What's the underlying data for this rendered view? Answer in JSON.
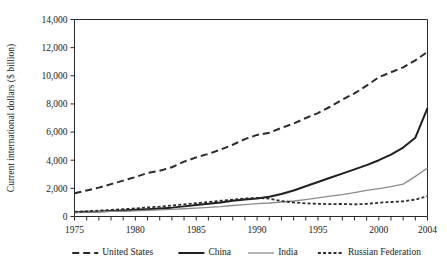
{
  "chart_data": {
    "type": "line",
    "title": "",
    "xlabel": "",
    "ylabel": "Current international dollars ($ billion)",
    "xlim": [
      1975,
      2004
    ],
    "ylim": [
      0,
      14000
    ],
    "grid": false,
    "legend_position": "bottom",
    "x_ticks_labeled": [
      "1975",
      "1980",
      "1985",
      "1990",
      "1995",
      "2000",
      "2004"
    ],
    "x_ticks_labeled_values": [
      1975,
      1980,
      1985,
      1990,
      1995,
      2000,
      2004
    ],
    "x_tick_interval_minor": 1,
    "y_ticks": [
      0,
      2000,
      4000,
      6000,
      8000,
      10000,
      12000,
      14000
    ],
    "y_tick_labels": [
      "0",
      "2,000",
      "4,000",
      "6,000",
      "8,000",
      "10,000",
      "12,000",
      "14,000"
    ],
    "x": [
      1975,
      1976,
      1977,
      1978,
      1979,
      1980,
      1981,
      1982,
      1983,
      1984,
      1985,
      1986,
      1987,
      1988,
      1989,
      1990,
      1991,
      1992,
      1993,
      1994,
      1995,
      1996,
      1997,
      1998,
      1999,
      2000,
      2001,
      2002,
      2003,
      2004
    ],
    "series": [
      {
        "name": "United States",
        "color": "#2b2b2b",
        "line_style": "long-dash",
        "line_width": 2,
        "values": [
          1650,
          1850,
          2050,
          2300,
          2550,
          2800,
          3100,
          3250,
          3500,
          3900,
          4200,
          4450,
          4750,
          5100,
          5500,
          5800,
          5950,
          6300,
          6600,
          7000,
          7350,
          7800,
          8300,
          8750,
          9300,
          9900,
          10250,
          10600,
          11100,
          11700
        ]
      },
      {
        "name": "China",
        "color": "#1f1f1f",
        "line_style": "solid",
        "line_width": 2,
        "values": [
          300,
          330,
          350,
          390,
          430,
          480,
          520,
          570,
          630,
          720,
          820,
          900,
          1000,
          1120,
          1200,
          1280,
          1400,
          1600,
          1850,
          2150,
          2450,
          2750,
          3050,
          3350,
          3650,
          4000,
          4400,
          4900,
          5600,
          7700
        ]
      },
      {
        "name": "India",
        "color": "#8c8c8c",
        "line_style": "solid",
        "line_width": 1.3,
        "values": [
          300,
          310,
          340,
          370,
          370,
          400,
          440,
          470,
          510,
          550,
          600,
          650,
          700,
          780,
          850,
          920,
          960,
          1030,
          1100,
          1200,
          1320,
          1450,
          1550,
          1700,
          1850,
          1980,
          2120,
          2300,
          2850,
          3450
        ]
      },
      {
        "name": "Russian Federation",
        "color": "#2b2b2b",
        "line_style": "short-dash",
        "line_width": 1.8,
        "values": [
          330,
          370,
          420,
          470,
          520,
          570,
          640,
          700,
          780,
          860,
          940,
          1030,
          1120,
          1200,
          1280,
          1320,
          1270,
          1100,
          1000,
          930,
          900,
          880,
          890,
          860,
          900,
          980,
          1030,
          1080,
          1200,
          1450
        ]
      }
    ]
  }
}
